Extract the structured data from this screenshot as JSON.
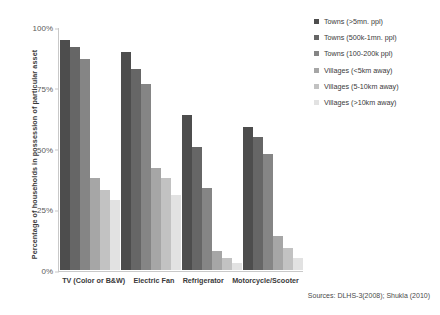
{
  "chart_data": {
    "type": "bar",
    "title": "",
    "xlabel": "",
    "ylabel": "Percentage of households in possession of particular asset",
    "ylim": [
      0,
      100
    ],
    "ytick_labels": [
      "100%",
      "75%",
      "50%",
      "25%",
      "0%"
    ],
    "ytick_values": [
      100,
      75,
      50,
      25,
      0
    ],
    "grid": false,
    "legend_position": "right",
    "categories": [
      "TV (Color or B&W)",
      "Electric Fan",
      "Refrigerator",
      "Motorcycle/Scooter"
    ],
    "series": [
      {
        "name": "Towns (>5mn. ppl)",
        "color": "#4d4d4d",
        "values": [
          95,
          90,
          64,
          59
        ]
      },
      {
        "name": "Towns (500k-1mn. ppl)",
        "color": "#666666",
        "values": [
          92,
          83,
          51,
          55
        ]
      },
      {
        "name": "Towns (100-200k ppl)",
        "color": "#858585",
        "values": [
          87,
          77,
          34,
          48
        ]
      },
      {
        "name": "Villages (<5km away)",
        "color": "#a6a6a6",
        "values": [
          38,
          42,
          8,
          14
        ]
      },
      {
        "name": "Villages (5-10km away)",
        "color": "#c2c2c2",
        "values": [
          33,
          38,
          5,
          9
        ]
      },
      {
        "name": "Villages (>10km away)",
        "color": "#e2e2e2",
        "values": [
          29,
          31,
          3,
          5
        ]
      }
    ],
    "source_note": "Sources: DLHS-3(2008); Shukla (2010)"
  }
}
